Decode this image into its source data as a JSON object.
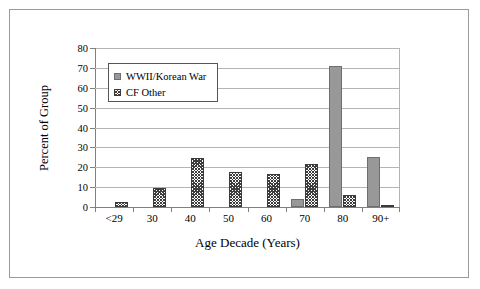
{
  "chart_data": {
    "type": "bar",
    "title": "",
    "xlabel": "Age Decade (Years)",
    "ylabel": "Percent of Group",
    "categories": [
      "<29",
      "30",
      "40",
      "50",
      "60",
      "70",
      "80",
      "90+"
    ],
    "series": [
      {
        "name": "WWII/Korean War",
        "values": [
          0,
          0,
          0,
          0,
          0,
          4,
          71,
          25
        ]
      },
      {
        "name": "CF Other",
        "values": [
          2.5,
          9.5,
          24.5,
          17.8,
          16.7,
          21.5,
          6.2,
          0.4
        ]
      }
    ],
    "ylim": [
      0,
      80
    ],
    "yticks": [
      0,
      10,
      20,
      30,
      40,
      50,
      60,
      70,
      80
    ],
    "ytick_labels": [
      "0",
      "10",
      "20",
      "30",
      "40",
      "50",
      "60",
      "70",
      "80"
    ],
    "grid": true,
    "legend_position": "upper-left-inside",
    "colors": {
      "series_1_fill": "#989898",
      "series_2_fill": "#ffffff",
      "series_2_hatch": "#3d3d3d",
      "gridline": "#b4b4b4",
      "axis": "#808080",
      "frame_border": "#9a9a9a"
    }
  }
}
